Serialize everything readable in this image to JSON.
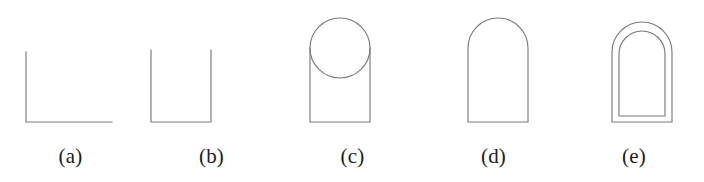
{
  "figure": {
    "background_color": "#ffffff",
    "stroke_color": "#7a7a7a",
    "caption_color": "#1c1c1c",
    "panels": [
      {
        "label": "(a)",
        "shape_name": "corner-lines",
        "description": "vertical line meeting a horizontal line at a right angle"
      },
      {
        "label": "(b)",
        "shape_name": "open-top-rectangle",
        "description": "U shape: two vertical lines joined by a horizontal base"
      },
      {
        "label": "(c)",
        "shape_name": "circle-over-open-rectangle",
        "description": "full circle overlapping the top of an open rectangle"
      },
      {
        "label": "(d)",
        "shape_name": "arch-outline",
        "description": "rectangle capped by a semicircular arch"
      },
      {
        "label": "(e)",
        "shape_name": "nested-double-arch",
        "description": "arch outline with a second smaller arch nested inside"
      }
    ]
  }
}
